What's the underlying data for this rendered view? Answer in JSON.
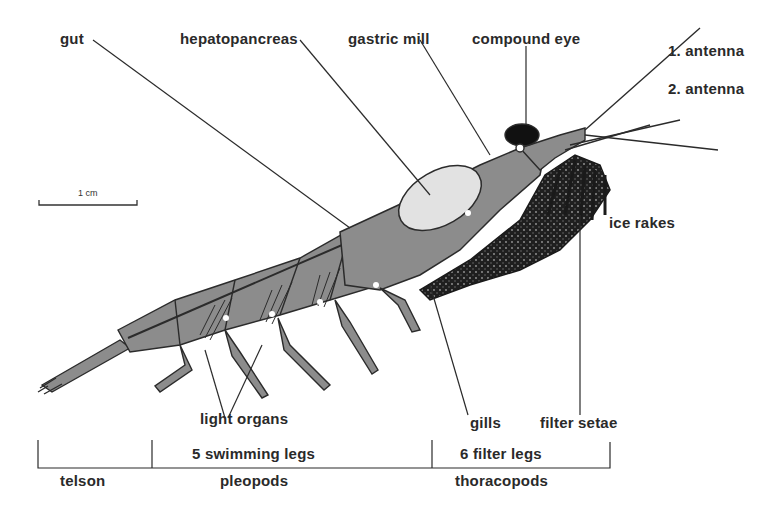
{
  "diagram": {
    "labels": {
      "gut": "gut",
      "hepatopancreas": "hepatopancreas",
      "gastric_mill": "gastric mill",
      "compound_eye": "compound eye",
      "antenna_1": "1. antenna",
      "antenna_2": "2. antenna",
      "ice_rakes": "ice rakes",
      "light_organs": "light organs",
      "gills": "gills",
      "filter_setae": "filter setae"
    },
    "scale_bar": {
      "label": "1 cm"
    },
    "body_regions": [
      {
        "top": "",
        "bottom": "telson"
      },
      {
        "top": "5 swimming legs",
        "bottom": "pleopods"
      },
      {
        "top": "6 filter legs",
        "bottom": "thoracopods"
      }
    ],
    "colors": {
      "body": "#8c8c8c",
      "hepatopancreas": "#e2e2e2",
      "outline": "#2b2b2b",
      "filter_basket": "#1e1e1e",
      "text": "#2a2a2a"
    }
  }
}
